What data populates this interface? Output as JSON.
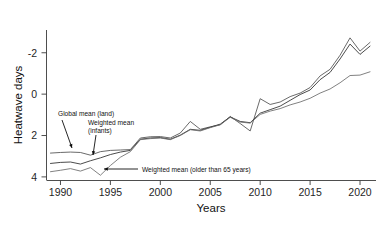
{
  "chart_data": {
    "type": "line",
    "title": "",
    "xlabel": "Years",
    "ylabel": "Heatwave days",
    "xlim": [
      1988.6,
      2021.6
    ],
    "ylim": [
      -2.15,
      5.1
    ],
    "xticks": [
      1990,
      1995,
      2000,
      2005,
      2010,
      2015,
      2020
    ],
    "yticks": [
      -2,
      0,
      2,
      4
    ],
    "grid": false,
    "legend_position": "none",
    "x": [
      1989,
      1990,
      1991,
      1992,
      1993,
      1994,
      1995,
      1996,
      1997,
      1998,
      1999,
      2000,
      2001,
      2002,
      2003,
      2004,
      2005,
      2006,
      2007,
      2008,
      2009,
      2010,
      2011,
      2012,
      2013,
      2014,
      2015,
      2016,
      2017,
      2018,
      2019,
      2020,
      2021
    ],
    "series": [
      {
        "name": "Global mean (land)",
        "color": "#4f4f4f",
        "values": [
          -0.85,
          -0.82,
          -0.8,
          -0.82,
          -0.95,
          -0.78,
          -0.72,
          -0.7,
          -0.68,
          -0.12,
          -0.06,
          -0.05,
          -0.12,
          0.12,
          0.68,
          0.3,
          0.42,
          0.52,
          0.92,
          0.58,
          0.22,
          1.78,
          1.5,
          1.62,
          1.88,
          2.05,
          2.32,
          2.88,
          3.2,
          3.88,
          4.72,
          4.08,
          4.5
        ]
      },
      {
        "name": "Weighted mean (infants)",
        "color": "#2b2b2b",
        "values": [
          -1.35,
          -1.3,
          -1.28,
          -1.38,
          -1.22,
          -1.08,
          -0.92,
          -0.8,
          -0.72,
          -0.18,
          -0.12,
          -0.1,
          -0.18,
          0.02,
          0.3,
          0.25,
          0.4,
          0.55,
          0.9,
          0.68,
          0.62,
          1.08,
          1.25,
          1.42,
          1.7,
          1.98,
          2.2,
          2.7,
          3.05,
          3.7,
          4.42,
          3.92,
          4.32
        ]
      },
      {
        "name": "Weighted mean (older than 65 years)",
        "color": "#6a6a6a",
        "values": [
          -1.75,
          -1.68,
          -1.6,
          -1.72,
          -1.55,
          -1.92,
          -1.45,
          -1.05,
          -0.78,
          -0.2,
          -0.15,
          -0.12,
          -0.2,
          0.0,
          0.28,
          0.22,
          0.38,
          0.52,
          0.88,
          0.65,
          0.6,
          1.02,
          1.18,
          1.3,
          1.48,
          1.62,
          1.8,
          2.05,
          2.25,
          2.55,
          2.9,
          2.92,
          3.08
        ]
      }
    ],
    "annotations": [
      {
        "id": "global-mean-land",
        "text": "Global mean (land)",
        "lines": [
          "Global mean (land)"
        ],
        "text_x": 58,
        "text_y": 116,
        "arrow_from_x": 62,
        "arrow_from_y": 120,
        "arrow_to_x": 72,
        "arrow_to_y": 148
      },
      {
        "id": "weighted-mean-infants",
        "text": "Weighted mean (infants)",
        "lines": [
          "Weighted mean",
          "(infants)"
        ],
        "text_x": 88,
        "text_y": 125,
        "arrow_from_x": 96,
        "arrow_from_y": 135,
        "arrow_to_x": 93,
        "arrow_to_y": 155
      },
      {
        "id": "weighted-mean-older-65",
        "text": "Weighted mean (older than 65 years)",
        "lines": [
          "Weighted mean (older than 65 years)"
        ],
        "text_x": 142,
        "text_y": 172,
        "arrow_from_x": 138,
        "arrow_from_y": 169,
        "arrow_to_x": 104,
        "arrow_to_y": 169
      }
    ]
  },
  "axes": {
    "y_title": "Heatwave days",
    "x_title": "Years",
    "y_tick_labels": [
      "4",
      "2",
      "0",
      "-2"
    ],
    "x_tick_labels": [
      "1990",
      "1995",
      "2000",
      "2005",
      "2010",
      "2015",
      "2020"
    ]
  }
}
